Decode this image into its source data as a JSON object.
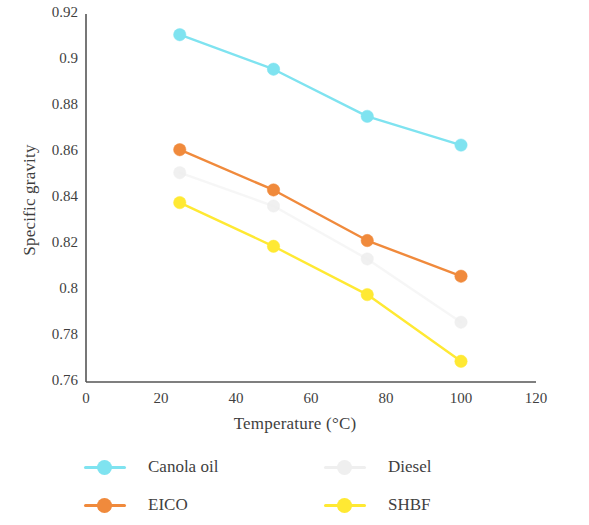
{
  "chart_data": {
    "type": "line",
    "title": "",
    "xlabel": "Temperature (°C)",
    "ylabel": "Specific gravity",
    "xlim": [
      0,
      120
    ],
    "ylim": [
      0.76,
      0.92
    ],
    "xticks": [
      0,
      20,
      40,
      60,
      80,
      100,
      120
    ],
    "xtick_labels": [
      "0",
      "20",
      "40",
      "60",
      "80",
      "100",
      "120"
    ],
    "yticks": [
      0.76,
      0.78,
      0.8,
      0.82,
      0.84,
      0.86,
      0.88,
      0.9,
      0.92
    ],
    "ytick_labels": [
      "0.76",
      "0.78",
      "0.8",
      "0.82",
      "0.84",
      "0.86",
      "0.88",
      "0.9",
      "0.92"
    ],
    "grid": false,
    "legend_position": "bottom",
    "x": [
      25,
      50,
      75,
      100
    ],
    "series": [
      {
        "name": "Canola oil",
        "color": "#7fe3f0",
        "marker": "circle",
        "values": [
          0.911,
          0.896,
          0.8755,
          0.863
        ]
      },
      {
        "name": "Diesel",
        "color": "#eeeeee",
        "marker": "circle",
        "values": [
          0.851,
          0.8365,
          0.8135,
          0.786
        ]
      },
      {
        "name": "EICO",
        "color": "#f08a3c",
        "marker": "circle",
        "values": [
          0.861,
          0.8435,
          0.8215,
          0.806
        ]
      },
      {
        "name": "SHBF",
        "color": "#ffe933",
        "marker": "circle",
        "values": [
          0.838,
          0.819,
          0.798,
          0.769
        ]
      }
    ]
  },
  "legend": {
    "entries": [
      {
        "label": "Canola oil",
        "color": "#7fe3f0"
      },
      {
        "label": "Diesel",
        "color": "#efefef"
      },
      {
        "label": "EICO",
        "color": "#f08a3c"
      },
      {
        "label": "SHBF",
        "color": "#ffe933"
      }
    ]
  },
  "axes": {
    "axis_color": "#555555"
  }
}
